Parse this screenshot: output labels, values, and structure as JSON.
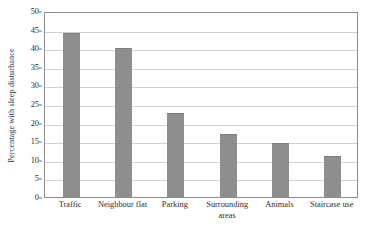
{
  "chart_data": {
    "type": "bar",
    "title": "",
    "xlabel": "",
    "ylabel": "Percentage with sleep disturbance",
    "categories": [
      "Traffic",
      "Neighbour flat",
      "Parking",
      "Surrounding areas",
      "Animals",
      "Staircase use"
    ],
    "values": [
      44,
      40,
      22.5,
      17,
      14.5,
      11
    ],
    "ylim": [
      0,
      50
    ],
    "ytick_values": [
      0,
      5,
      10,
      15,
      20,
      25,
      30,
      35,
      40,
      45,
      50
    ],
    "ytick_labels": [
      "0",
      "5",
      "10",
      "15",
      "20",
      "25",
      "30",
      "35",
      "40",
      "45",
      "50"
    ],
    "grid": true,
    "legend": false,
    "bar_color": "#8e8e8e",
    "grid_color": "#d2d2d2",
    "axis_color": "#8d8d8d"
  }
}
